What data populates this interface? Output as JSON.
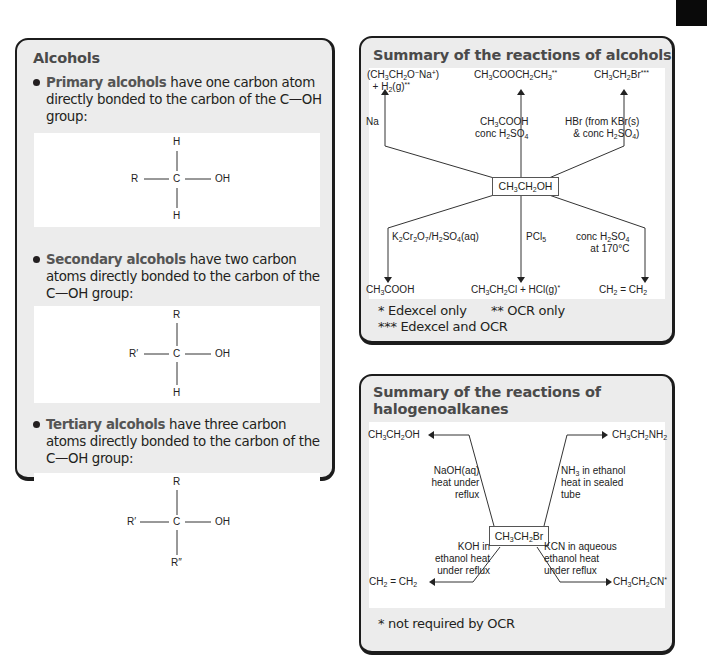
{
  "alcohols": {
    "title": "Alcohols",
    "primary": {
      "bold": "Primary alcohols",
      "text": " have one carbon atom directly bonded to the carbon of the C—OH group:",
      "structure": {
        "top": "H",
        "left": "R",
        "center": "C",
        "right": "OH",
        "bottom": "H"
      }
    },
    "secondary": {
      "bold": "Secondary alcohols",
      "text": " have two carbon atoms directly bonded to the carbon of the C—OH group:",
      "structure": {
        "top": "R",
        "left": "R′",
        "center": "C",
        "right": "OH",
        "bottom": "H"
      }
    },
    "tertiary": {
      "bold": "Tertiary alcohols",
      "text": " have three carbon atoms directly bonded to the carbon of the C—OH group:",
      "structure": {
        "top": "R",
        "left": "R′",
        "center": "C",
        "right": "OH",
        "bottom": "R″"
      }
    }
  },
  "alcohol_reactions": {
    "title": "Summary of the reactions of alcohols",
    "center": "CH3CH2OH",
    "products": {
      "sodium_ethoxide": "(CH3CH2O−Na+) + H2(g)**",
      "ester": "CH3COOCH2CH3**",
      "bromoethane": "CH3CH2Br***",
      "acid": "CH3COOH",
      "chloroethane": "CH3CH2Cl + HCl(g)*",
      "ethene": "CH2 = CH2"
    },
    "reagents": {
      "na": "Na",
      "esterification": "CH3COOH conc H2SO4",
      "hbr": "HBr (from KBr(s) & conc H2SO4)",
      "oxidation": "K2Cr2O7/H2SO4(aq)",
      "pcl5": "PCl5",
      "dehydration": "conc H2SO4 at 170°C"
    },
    "footnotes": {
      "f1": "* Edexcel only",
      "f2": "** OCR only",
      "f3": "*** Edexcel and OCR"
    }
  },
  "halogenoalkane_reactions": {
    "title_line1": "Summary of the reactions of",
    "title_line2": "halogenoalkanes",
    "center": "CH3CH2Br",
    "products": {
      "ethanol": "CH3CH2OH",
      "ethylamine": "CH3CH2NH2",
      "ethene": "CH2 = CH2",
      "nitrile": "CH3CH2CN*"
    },
    "reagents": {
      "naoh": "NaOH(aq) heat under reflux",
      "nh3": "NH3 in ethanol heat in sealed tube",
      "koh": "KOH in ethanol heat under reflux",
      "kcn": "KCN in aqueous ethanol heat under reflux"
    },
    "footnote": "* not required by OCR"
  }
}
